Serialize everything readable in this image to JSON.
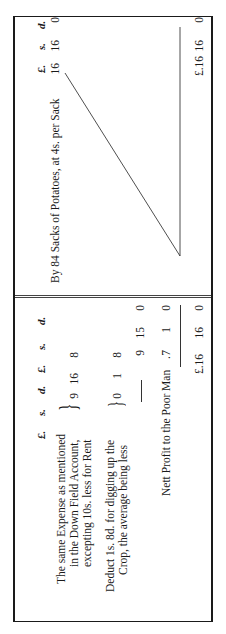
{
  "debit": {
    "headers": [
      "£.",
      "s.",
      "d.",
      "£.",
      "s.",
      "d."
    ],
    "entries": [
      {
        "lines": [
          "The same Expense as mentioned",
          "in the Down Field Account,",
          "excepting 10s. less for Rent"
        ],
        "pounds": "9",
        "shillings": "16",
        "pence": "8"
      },
      {
        "lines": [
          "Deduct 1s. 8d. for digging up the",
          "Crop, the average being less"
        ],
        "pounds": "0",
        "shillings": "1",
        "pence": "8"
      }
    ],
    "subtotal": {
      "pounds": "9",
      "shillings": "15",
      "pence": "0"
    },
    "profit": {
      "label": "Nett Profit to the Poor Man",
      "dot": ".",
      "pounds": "7",
      "shillings": "1",
      "pence": "0"
    },
    "total": {
      "pounds": "£.16",
      "shillings": "16",
      "pence": "0"
    }
  },
  "credit": {
    "headers": [
      "£.",
      "s.",
      "d."
    ],
    "entry": {
      "label": "By 84 Sacks of Potatoes, at 4s. per Sack",
      "pounds": "16",
      "shillings": "16",
      "pence": "0"
    },
    "total": {
      "pounds": "£.16",
      "shillings": "16",
      "pence": "0"
    }
  }
}
